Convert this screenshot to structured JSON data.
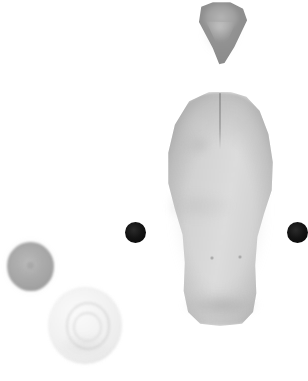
{
  "image": {
    "title": "Grayscale specimen scan",
    "background_color": "#ffffff",
    "width": 308,
    "height": 381,
    "modality": "grayscale blob imagery",
    "caption": ""
  },
  "objects": [
    {
      "id": "apex-cone",
      "name": "apex-cone",
      "label": "Triangular conical body (top center)",
      "shape": "triangle-cone",
      "fill_color": "#9a9a9a",
      "highlight_color": "#c4c4c4",
      "x": 192,
      "y": 1,
      "width": 58,
      "height": 64
    },
    {
      "id": "main-body",
      "name": "main-bilobed-body",
      "label": "Large pale bilobed elongated body (center right)",
      "shape": "bilobed-oval",
      "fill_color": "#d2d2d2",
      "edge_color": "#9c9c9c",
      "cleft_color": "#949494",
      "x": 158,
      "y": 86,
      "width": 124,
      "height": 248
    },
    {
      "id": "marker-left",
      "name": "marker-dot-left",
      "label": "Black marker dot (left)",
      "shape": "circle",
      "fill_color": "#0b0b0b",
      "x": 125,
      "y": 222,
      "width": 21,
      "height": 21
    },
    {
      "id": "marker-right",
      "name": "marker-dot-right",
      "label": "Black marker dot (right, cropped at edge)",
      "shape": "circle",
      "fill_color": "#0b0b0b",
      "x": 287,
      "y": 222,
      "width": 21,
      "height": 21
    },
    {
      "id": "sphere-gray",
      "name": "gray-sphere",
      "label": "Medium gray textured sphere (lower left)",
      "shape": "sphere",
      "fill_color": "#a8a8a8",
      "highlight_color": "#bebebe",
      "x": 7,
      "y": 242,
      "width": 47,
      "height": 49
    },
    {
      "id": "sphere-pale",
      "name": "pale-swirl-sphere",
      "label": "Large pale sphere with concentric swirl (lower left)",
      "shape": "sphere",
      "fill_color": "#f0f0f0",
      "ring_color": "#d8d8d8",
      "x": 48,
      "y": 287,
      "width": 74,
      "height": 77
    }
  ],
  "details": {
    "main_body_pores": [
      {
        "name": "pore-left",
        "x": 210,
        "y": 256,
        "size": 4
      },
      {
        "name": "pore-right",
        "x": 238,
        "y": 255,
        "size": 4
      }
    ],
    "main_body_cleft": {
      "name": "apical-cleft",
      "x": 219,
      "y": 93,
      "length": 56
    }
  }
}
